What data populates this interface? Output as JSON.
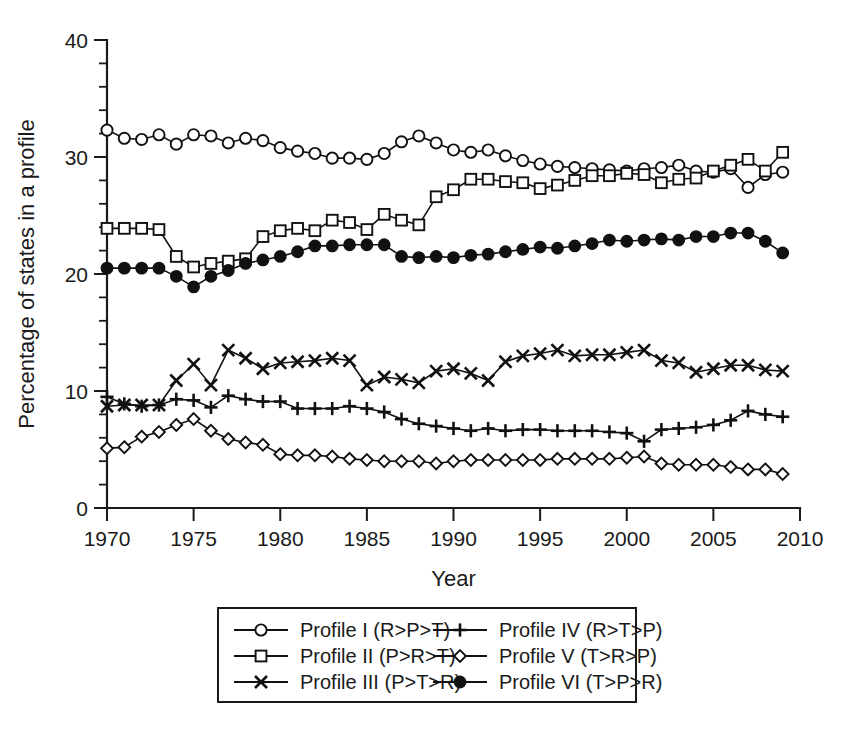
{
  "chart_data": {
    "type": "line",
    "title": "",
    "xlabel": "Year",
    "ylabel": "Percentage of states in a profile",
    "xlim": [
      1970,
      2010
    ],
    "ylim": [
      0,
      40
    ],
    "grid": false,
    "legend_position": "bottom-center",
    "xticks": [
      1970,
      1975,
      1980,
      1985,
      1990,
      1995,
      2000,
      2005,
      2010
    ],
    "xticklabels": [
      "1970",
      "1975",
      "1980",
      "1985",
      "1990",
      "1995",
      "2000",
      "2005",
      "2010"
    ],
    "yticks": [
      0,
      10,
      20,
      30,
      40
    ],
    "yticklabels": [
      "0",
      "10",
      "20",
      "30",
      "40"
    ],
    "yminor_step": 2,
    "x": [
      1970,
      1971,
      1972,
      1973,
      1974,
      1975,
      1976,
      1977,
      1978,
      1979,
      1980,
      1981,
      1982,
      1983,
      1984,
      1985,
      1986,
      1987,
      1988,
      1989,
      1990,
      1991,
      1992,
      1993,
      1994,
      1995,
      1996,
      1997,
      1998,
      1999,
      2000,
      2001,
      2002,
      2003,
      2004,
      2005,
      2006,
      2007,
      2008,
      2009
    ],
    "series": [
      {
        "name": "Profile I (R>P>T)",
        "marker": "open-circle",
        "values": [
          32.3,
          31.6,
          31.5,
          31.9,
          31.1,
          31.9,
          31.8,
          31.2,
          31.6,
          31.4,
          30.8,
          30.5,
          30.3,
          29.9,
          29.9,
          29.8,
          30.3,
          31.3,
          31.8,
          31.2,
          30.6,
          30.4,
          30.6,
          30.1,
          29.7,
          29.4,
          29.2,
          29.1,
          29.0,
          28.9,
          28.8,
          29.0,
          29.1,
          29.3,
          28.8,
          28.7,
          29.0,
          27.4,
          28.5,
          28.7
        ]
      },
      {
        "name": "Profile II (P>R>T)",
        "marker": "open-square",
        "values": [
          23.9,
          23.9,
          23.9,
          23.8,
          21.5,
          20.6,
          20.9,
          21.1,
          21.3,
          23.2,
          23.7,
          23.9,
          23.7,
          24.6,
          24.4,
          23.8,
          25.1,
          24.6,
          24.2,
          26.6,
          27.2,
          28.1,
          28.1,
          27.9,
          27.8,
          27.3,
          27.6,
          28.0,
          28.4,
          28.4,
          28.6,
          28.5,
          27.8,
          28.1,
          28.2,
          28.8,
          29.3,
          29.8,
          28.8,
          30.4
        ]
      },
      {
        "name": "Profile III (P>T>R)",
        "marker": "cross-x",
        "values": [
          8.7,
          8.8,
          8.8,
          8.8,
          10.9,
          12.3,
          10.5,
          13.5,
          12.8,
          11.9,
          12.4,
          12.5,
          12.6,
          12.8,
          12.6,
          10.5,
          11.2,
          11.0,
          10.7,
          11.7,
          11.9,
          11.5,
          10.9,
          12.5,
          13.0,
          13.2,
          13.5,
          13.0,
          13.1,
          13.1,
          13.3,
          13.5,
          12.6,
          12.4,
          11.6,
          11.9,
          12.2,
          12.2,
          11.8,
          11.7
        ]
      },
      {
        "name": "Profile IV (R>T>P)",
        "marker": "plus",
        "values": [
          9.5,
          8.9,
          8.7,
          8.8,
          9.3,
          9.2,
          8.6,
          9.6,
          9.3,
          9.1,
          9.1,
          8.5,
          8.5,
          8.5,
          8.7,
          8.5,
          8.2,
          7.6,
          7.2,
          7.0,
          6.8,
          6.6,
          6.8,
          6.6,
          6.7,
          6.7,
          6.6,
          6.6,
          6.6,
          6.5,
          6.4,
          5.7,
          6.7,
          6.8,
          6.9,
          7.1,
          7.5,
          8.3,
          8.0,
          7.8
        ]
      },
      {
        "name": "Profile V (T>R>P)",
        "marker": "open-diamond",
        "values": [
          5.1,
          5.2,
          6.1,
          6.5,
          7.1,
          7.6,
          6.6,
          5.9,
          5.6,
          5.4,
          4.6,
          4.5,
          4.5,
          4.4,
          4.2,
          4.1,
          4.0,
          4.0,
          4.0,
          3.8,
          4.0,
          4.1,
          4.1,
          4.1,
          4.1,
          4.1,
          4.2,
          4.2,
          4.2,
          4.2,
          4.3,
          4.4,
          3.8,
          3.7,
          3.7,
          3.7,
          3.5,
          3.3,
          3.3,
          2.9
        ]
      },
      {
        "name": "Profile VI (T>P>R)",
        "marker": "filled-circle",
        "values": [
          20.5,
          20.5,
          20.5,
          20.5,
          19.8,
          18.9,
          19.8,
          20.3,
          20.9,
          21.2,
          21.5,
          21.9,
          22.4,
          22.4,
          22.5,
          22.5,
          22.5,
          21.5,
          21.4,
          21.5,
          21.4,
          21.6,
          21.7,
          21.9,
          22.1,
          22.3,
          22.2,
          22.4,
          22.6,
          22.9,
          22.8,
          22.9,
          23.0,
          22.9,
          23.2,
          23.2,
          23.5,
          23.5,
          22.8,
          21.8
        ]
      }
    ]
  },
  "legend": {
    "columns": [
      [
        {
          "label": "Profile I (R>P>T)",
          "marker": "open-circle"
        },
        {
          "label": "Profile II (P>R>T)",
          "marker": "open-square"
        },
        {
          "label": "Profile III (P>T>R)",
          "marker": "cross-x"
        }
      ],
      [
        {
          "label": "Profile IV (R>T>P)",
          "marker": "plus"
        },
        {
          "label": "Profile V (T>R>P)",
          "marker": "open-diamond"
        },
        {
          "label": "Profile VI (T>P>R)",
          "marker": "filled-circle"
        }
      ]
    ]
  },
  "colors": {
    "ink": "#111111",
    "background": "#ffffff"
  }
}
